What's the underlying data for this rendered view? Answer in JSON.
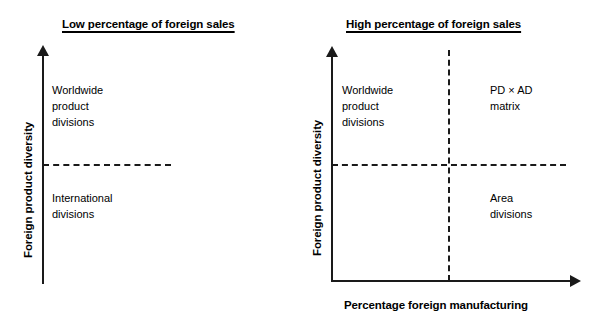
{
  "diagram": {
    "type": "two-panel-quadrant-matrix",
    "panels": [
      {
        "id": "low-foreign-sales",
        "title": "Low percentage of foreign sales",
        "y_axis_label": "Foreign product diversity",
        "x_axis_label": "",
        "quadrants": {
          "top_left": [
            "Worldwide",
            "product",
            "divisions"
          ],
          "top_right": [],
          "bottom_left": [
            "International",
            "divisions"
          ],
          "bottom_right": []
        }
      },
      {
        "id": "high-foreign-sales",
        "title": "High percentage of foreign sales",
        "y_axis_label": "Foreign product diversity",
        "x_axis_label": "Percentage foreign manufacturing",
        "quadrants": {
          "top_left": [
            "Worldwide",
            "product",
            "divisions"
          ],
          "top_right": [
            "PD × AD",
            "matrix"
          ],
          "bottom_left": [],
          "bottom_right": [
            "Area",
            "divisions"
          ]
        }
      }
    ],
    "colors": {
      "line": "#1a1a1a",
      "text": "#000000",
      "background": "#ffffff"
    }
  },
  "left": {
    "title": "Low percentage of foreign sales",
    "ylabel": "Foreign product diversity",
    "quad_tl": {
      "l1": "Worldwide",
      "l2": "product",
      "l3": "divisions"
    },
    "quad_bl": {
      "l1": "International",
      "l2": "divisions"
    }
  },
  "right": {
    "title": "High percentage of foreign sales",
    "ylabel": "Foreign product diversity",
    "xlabel": "Percentage foreign manufacturing",
    "quad_tl": {
      "l1": "Worldwide",
      "l2": "product",
      "l3": "divisions"
    },
    "quad_tr": {
      "l1": "PD × AD",
      "l2": "matrix"
    },
    "quad_br": {
      "l1": "Area",
      "l2": "divisions"
    }
  }
}
